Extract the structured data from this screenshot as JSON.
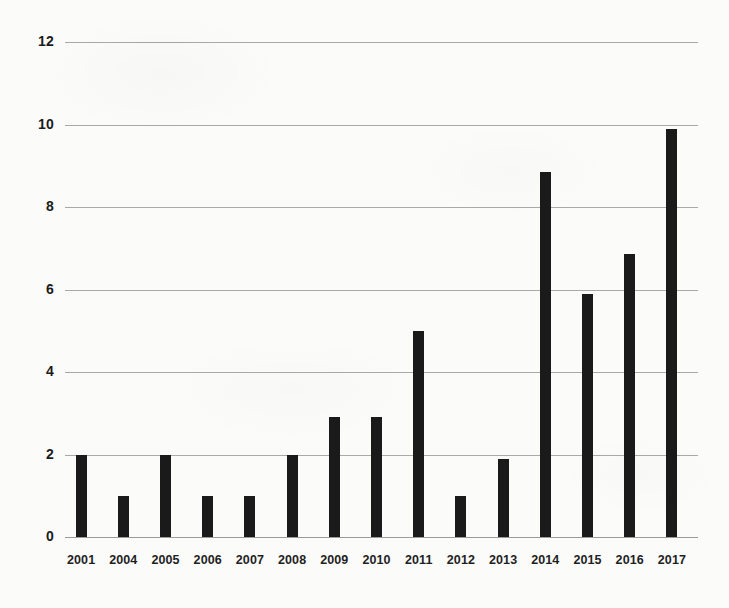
{
  "chart_data": {
    "type": "bar",
    "title": "",
    "subtitle": "",
    "xlabel": "",
    "ylabel": "",
    "categories": [
      "2001",
      "2004",
      "2005",
      "2006",
      "2007",
      "2008",
      "2009",
      "2010",
      "2011",
      "2012",
      "2013",
      "2014",
      "2015",
      "2016",
      "2017"
    ],
    "values": [
      2,
      1,
      2,
      1,
      1,
      2,
      2.9,
      2.9,
      5,
      1,
      1.9,
      8.85,
      5.9,
      6.85,
      9.9
    ],
    "series": [
      {
        "name": "",
        "values": [
          2,
          1,
          2,
          1,
          1,
          2,
          2.9,
          2.9,
          5,
          1,
          1.9,
          8.85,
          5.9,
          6.85,
          9.9
        ]
      }
    ],
    "ylim": [
      0,
      12
    ],
    "yticks": [
      0,
      2,
      4,
      6,
      8,
      10,
      12
    ],
    "ytick_labels": [
      "0",
      "2",
      "4",
      "6",
      "8",
      "10",
      "12"
    ],
    "grid": true,
    "grid_axis": "y",
    "legend": false,
    "legend_position": "none",
    "annotations": [],
    "colors": {
      "bar": "#1a1a1a",
      "gridline": "#9a9a98",
      "text": "#1b1b1b",
      "background": "#fbfbfa"
    }
  }
}
